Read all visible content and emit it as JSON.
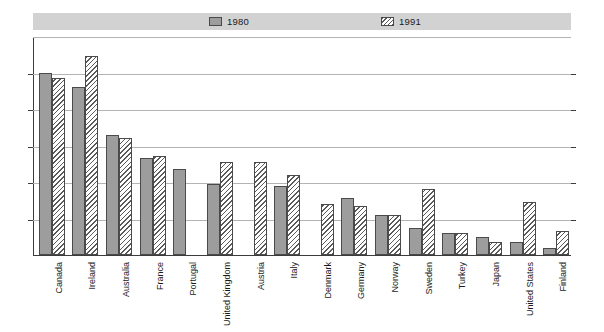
{
  "chart_data": {
    "type": "bar",
    "title": "",
    "xlabel": "",
    "ylabel": "",
    "ylim": [
      0,
      60
    ],
    "yticks": [
      0,
      10,
      20,
      30,
      40,
      50,
      60
    ],
    "grid": true,
    "legend_position": "top",
    "dual_y_axis": true,
    "categories": [
      "Canada",
      "Ireland",
      "Australia",
      "France",
      "Portugal",
      "United Kingdom",
      "Austria",
      "Italy",
      "Denmark",
      "Germany",
      "Norway",
      "Sweden",
      "Turkey",
      "Japan",
      "United States",
      "Finland"
    ],
    "series": [
      {
        "name": "1980",
        "values": [
          50,
          46,
          33,
          26.5,
          23.5,
          19.5,
          null,
          19,
          null,
          15.5,
          11,
          7.5,
          6,
          5,
          3.5,
          2
        ]
      },
      {
        "name": "1991",
        "values": [
          48.5,
          54.5,
          32,
          27,
          null,
          25.5,
          25.5,
          22,
          14,
          13.5,
          11,
          18,
          6,
          3.5,
          14.5,
          6.5
        ]
      }
    ]
  },
  "legend": {
    "items": [
      {
        "label": "1980",
        "pattern": "solid"
      },
      {
        "label": "1991",
        "pattern": "hatch"
      }
    ]
  },
  "axis": {
    "left_ticks": [
      "60",
      "50",
      "40",
      "30",
      "20",
      "10",
      "0"
    ],
    "right_ticks": [
      "60",
      "50",
      "40",
      "30",
      "20",
      "10",
      "0"
    ]
  },
  "colors": {
    "series_1980": "#9d9d9d",
    "series_1991_line": "#5a5a5a",
    "bar_border": "#4a4a4a",
    "gridline": "#b4b4b4",
    "axis": "#3c3c3c",
    "legend_band": "#d2d2d2",
    "text": "#1a1a1a",
    "background": "#ffffff"
  }
}
